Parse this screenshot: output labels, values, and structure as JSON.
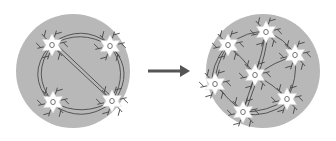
{
  "diagram": {
    "colors": {
      "background": "#ffffff",
      "circle_fill": "#b8b8b8",
      "neuron_fill": "#ffffff",
      "line": "#555555",
      "arrow": "#555555"
    },
    "left_panel": {
      "label": "sparse",
      "center": [
        73,
        71
      ],
      "radius": 57,
      "neurons": [
        {
          "x": 52,
          "y": 45,
          "label": "O"
        },
        {
          "x": 110,
          "y": 46,
          "label": "O"
        },
        {
          "x": 53,
          "y": 102,
          "label": "O"
        },
        {
          "x": 112,
          "y": 101,
          "label": "O"
        }
      ]
    },
    "arrow": {
      "from": [
        148,
        71
      ],
      "to": [
        190,
        71
      ]
    },
    "right_panel": {
      "label": "dense",
      "center": [
        263,
        71
      ],
      "radius": 57,
      "neurons": [
        {
          "x": 228,
          "y": 45,
          "label": "O"
        },
        {
          "x": 266,
          "y": 32,
          "label": "O"
        },
        {
          "x": 295,
          "y": 55,
          "label": "O"
        },
        {
          "x": 255,
          "y": 75,
          "label": "O"
        },
        {
          "x": 215,
          "y": 84,
          "label": "O"
        },
        {
          "x": 287,
          "y": 99,
          "label": "O"
        },
        {
          "x": 243,
          "y": 112,
          "label": "O"
        }
      ]
    }
  }
}
